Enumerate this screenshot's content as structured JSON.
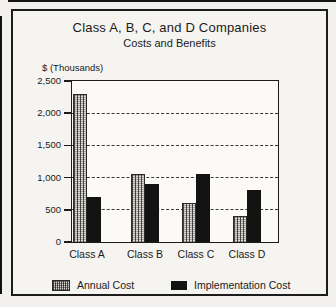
{
  "chart_data": {
    "type": "bar",
    "title": "Class A, B, C, and D Companies",
    "subtitle": "Costs and Benefits",
    "ylabel": "$ (Thousands)",
    "categories": [
      "Class A",
      "Class B",
      "Class C",
      "Class D"
    ],
    "series": [
      {
        "name": "Annual Cost",
        "style": "hatched",
        "values": [
          2300,
          1050,
          600,
          400
        ]
      },
      {
        "name": "Implementation Cost",
        "style": "solid",
        "values": [
          700,
          900,
          1050,
          800
        ]
      }
    ],
    "ylim": [
      0,
      2500
    ],
    "yticks": [
      0,
      500,
      1000,
      1500,
      2000,
      2500
    ],
    "ytick_labels": [
      "0",
      "500",
      "1,000",
      "1,500",
      "2,000",
      "2,500"
    ],
    "gridlines": "horizontal dashed at 500, 1000, 1500, 2000",
    "legend_position": "bottom"
  },
  "legend": {
    "annual_label": "Annual Cost",
    "implementation_label": "Implementation Cost"
  },
  "colors": {
    "frame_border": "#1c1c1c",
    "background": "#f2f1ed",
    "plot_background": "#fbfaf7",
    "implementation_bar": "#131313",
    "annual_bar_pattern_base": "#dddbd4"
  }
}
